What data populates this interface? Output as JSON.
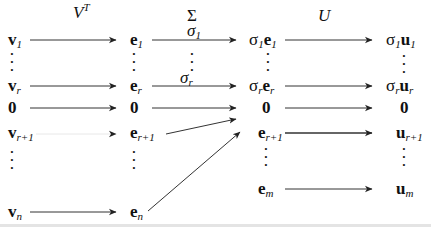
{
  "headers": {
    "vt": {
      "base": "V",
      "sup": "T"
    },
    "sigma": "Σ",
    "u": "U"
  },
  "col_v": {
    "v1": {
      "base": "v",
      "sub": "1"
    },
    "vr": {
      "base": "v",
      "sub": "r"
    },
    "zero": "0",
    "vr1": {
      "base": "v",
      "sub": "r+1"
    },
    "vn": {
      "base": "v",
      "sub": "n"
    }
  },
  "col_e": {
    "e1": {
      "base": "e",
      "sub": "1"
    },
    "er": {
      "base": "e",
      "sub": "r"
    },
    "zero": "0",
    "er1": {
      "base": "e",
      "sub": "r+1"
    },
    "en": {
      "base": "e",
      "sub": "n"
    }
  },
  "arrow_labels": {
    "sigma1": {
      "base": "σ",
      "sub": "1"
    },
    "sigmar": {
      "base": "σ",
      "sub": "r"
    }
  },
  "col_se": {
    "s1e1": {
      "s": "σ",
      "ss": "1",
      "base": "e",
      "sub": "1"
    },
    "srer": {
      "s": "σ",
      "ss": "r",
      "base": "e",
      "sub": "r"
    },
    "zero": "0",
    "er1": {
      "base": "e",
      "sub": "r+1"
    },
    "em": {
      "base": "e",
      "sub": "m"
    }
  },
  "col_su": {
    "s1u1": {
      "s": "σ",
      "ss": "1",
      "base": "u",
      "sub": "1"
    },
    "srur": {
      "s": "σ",
      "ss": "r",
      "base": "u",
      "sub": "r"
    },
    "zero": "0",
    "ur1": {
      "base": "u",
      "sub": "r+1"
    },
    "um": {
      "base": "u",
      "sub": "m"
    }
  },
  "dots": "⋮"
}
